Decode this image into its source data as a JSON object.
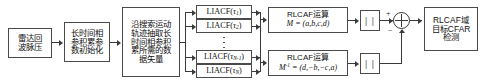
{
  "diagram": {
    "stages": {
      "radar_echo": "雷达回波脉压",
      "param_init": "长时间相参积累参数初始化",
      "data_extract": "沿搜索运动轨迹抽取长时间相参积累所需的数据矢量",
      "cfar_detect": "RLCAF域目标CFAR检测"
    },
    "liacf_blocks": [
      {
        "name": "LIACF",
        "arg_base": "τ",
        "arg_sub": "1"
      },
      {
        "name": "LIACF",
        "arg_base": "τ",
        "arg_sub": "2"
      },
      {
        "name": "LIACF",
        "arg_base": "τ",
        "arg_sub": "N-1"
      },
      {
        "name": "LIACF",
        "arg_base": "τ",
        "arg_sub": "N"
      }
    ],
    "rlcaf_blocks": [
      {
        "label": "RLCAF运算",
        "matrix": "M = (a,b,c,d)"
      },
      {
        "label": "RLCAF运算",
        "matrix": "M⁻¹ = (d,−b,−c,a)"
      }
    ],
    "abs_blocks": [
      {
        "label": "| |"
      },
      {
        "label": "| |"
      }
    ],
    "sum_junction": {
      "plus_sign": "+",
      "minus_sign": "−"
    },
    "colors": {
      "stroke": "#4a4a4a",
      "text": "#111111",
      "background": "#ffffff"
    }
  }
}
